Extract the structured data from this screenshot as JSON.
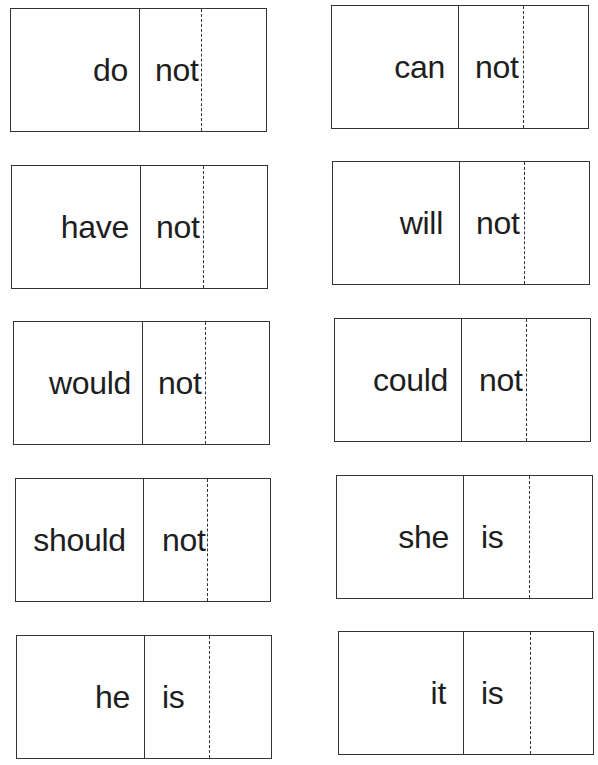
{
  "worksheet": {
    "topic": "contractions word cards",
    "cards": [
      {
        "word": "do",
        "second": "not"
      },
      {
        "word": "can",
        "second": "not"
      },
      {
        "word": "have",
        "second": "not"
      },
      {
        "word": "will",
        "second": "not"
      },
      {
        "word": "would",
        "second": "not"
      },
      {
        "word": "could",
        "second": "not"
      },
      {
        "word": "should",
        "second": "not"
      },
      {
        "word": "she",
        "second": "is"
      },
      {
        "word": "he",
        "second": "is"
      },
      {
        "word": "it",
        "second": "is"
      }
    ]
  },
  "colors": {
    "line": "#333333",
    "text": "#1e1e1e",
    "background": "#ffffff"
  }
}
